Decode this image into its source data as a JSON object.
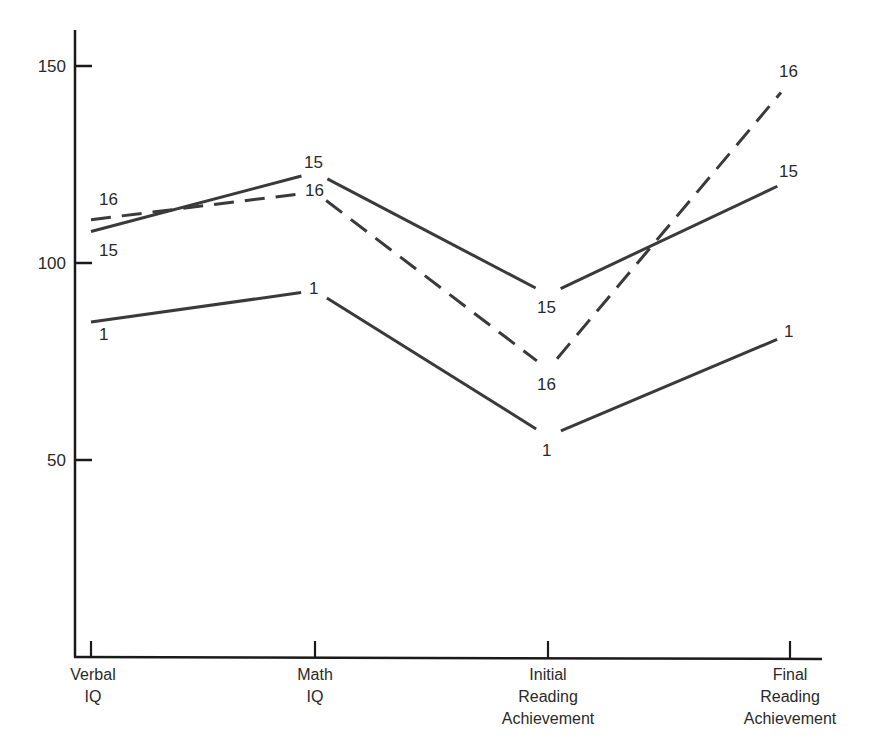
{
  "chart_data": {
    "type": "line",
    "title": "",
    "xlabel": "",
    "ylabel": "",
    "ylim": [
      0,
      160
    ],
    "grid": false,
    "legend": "none (series labeled inline at each point)",
    "categories": [
      "Verbal IQ",
      "Math IQ",
      "Initial Reading Achievement",
      "Final Reading Achievement"
    ],
    "category_lines": [
      [
        "Verbal",
        "IQ"
      ],
      [
        "Math",
        "IQ"
      ],
      [
        "Initial",
        "Reading",
        "Achievement"
      ],
      [
        "Final",
        "Reading",
        "Achievement"
      ]
    ],
    "yticks": [
      50,
      100,
      150
    ],
    "series": [
      {
        "name": "1",
        "style": "solid",
        "values": [
          85,
          93,
          56,
          82
        ]
      },
      {
        "name": "15",
        "style": "solid",
        "values": [
          108,
          123,
          92,
          121
        ]
      },
      {
        "name": "16",
        "style": "dashed",
        "values": [
          111,
          118,
          73,
          146
        ]
      }
    ]
  },
  "colors": {
    "line": "#3a3a3a",
    "axis": "#1a1a1a",
    "text": "#2a2a2a",
    "background": "#ffffff"
  }
}
